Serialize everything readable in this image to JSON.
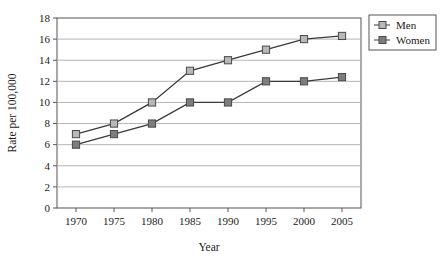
{
  "chart_data": {
    "type": "line",
    "title": "",
    "xlabel": "Year",
    "ylabel": "Rate per 100,000",
    "x": [
      1970,
      1975,
      1980,
      1985,
      1990,
      1995,
      2000,
      2005
    ],
    "xticklabels": [
      "1970",
      "1975",
      "1980",
      "1985",
      "1990",
      "1995",
      "2000",
      "2005"
    ],
    "yticks": [
      0,
      2,
      4,
      6,
      8,
      10,
      12,
      14,
      16,
      18
    ],
    "yticklabels": [
      "0",
      "2",
      "4",
      "6",
      "8",
      "10",
      "12",
      "14",
      "16",
      "18"
    ],
    "xlim": [
      1967.5,
      2007.5
    ],
    "ylim": [
      0,
      18
    ],
    "grid": "horizontal",
    "legend_position": "right",
    "series": [
      {
        "name": "Men",
        "marker": "square",
        "marker_fill": "#b8b8b8",
        "line_color": "#3a3a3a",
        "values": [
          7,
          8,
          10,
          13,
          14,
          15,
          16,
          16.3
        ]
      },
      {
        "name": "Women",
        "marker": "square",
        "marker_fill": "#7d7d7d",
        "line_color": "#3a3a3a",
        "values": [
          6,
          7,
          8,
          10,
          10,
          12,
          12,
          12.4
        ]
      }
    ]
  },
  "legend": {
    "items": [
      {
        "label": "Men"
      },
      {
        "label": "Women"
      }
    ]
  },
  "axes": {
    "x_title": "Year",
    "y_title": "Rate per 100,000"
  },
  "colors": {
    "men_marker": "#b8b8b8",
    "women_marker": "#7d7d7d",
    "line": "#3a3a3a",
    "grid": "#b5b5b5",
    "frame": "#555555",
    "text": "#1a1a1a",
    "background": "#ffffff"
  }
}
